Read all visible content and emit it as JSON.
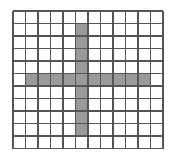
{
  "figure": {
    "type": "grid-shape-diagram",
    "background_color": "#ffffff"
  },
  "grid": {
    "columns": 12,
    "rows": 11,
    "cell_width": 12.5,
    "cell_height": 12.5,
    "origin_x": 13,
    "origin_y": 11,
    "line_color": "#555555",
    "line_width": 1.6,
    "cell_fill_empty": "#ffffff",
    "cell_fill_shaded": "#9a9a9a"
  },
  "shape": {
    "name": "plus-cross",
    "shaded_cell_count": 19,
    "horizontal_bar": {
      "row": 5,
      "col_start": 1,
      "col_end": 10,
      "length": 10
    },
    "vertical_bar": {
      "column": 5,
      "row_start": 1,
      "row_end": 9,
      "length": 9
    },
    "shaded_cells": [
      [
        1,
        5
      ],
      [
        2,
        5
      ],
      [
        3,
        5
      ],
      [
        4,
        5
      ],
      [
        5,
        1
      ],
      [
        5,
        2
      ],
      [
        5,
        3
      ],
      [
        5,
        4
      ],
      [
        5,
        5
      ],
      [
        5,
        6
      ],
      [
        5,
        7
      ],
      [
        5,
        8
      ],
      [
        5,
        9
      ],
      [
        5,
        10
      ],
      [
        6,
        5
      ],
      [
        7,
        5
      ],
      [
        8,
        5
      ],
      [
        9,
        5
      ]
    ]
  }
}
